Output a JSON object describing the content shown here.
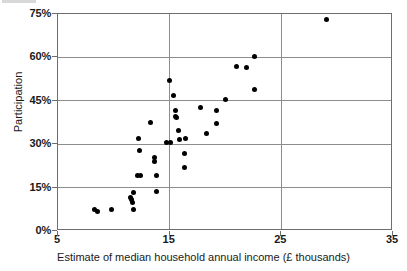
{
  "chart_data": {
    "type": "scatter",
    "title": "",
    "subtitle": "",
    "xlabel": "Estimate of median household annual income (£ thousands)",
    "ylabel": "Participation",
    "xlim": [
      5,
      35
    ],
    "ylim": [
      0,
      75
    ],
    "xticks": [
      5,
      15,
      25,
      35
    ],
    "xtick_labels": [
      "5",
      "15",
      "25",
      "35"
    ],
    "yticks": [
      0,
      15,
      30,
      45,
      60,
      75
    ],
    "ytick_labels": [
      "0%",
      "15%",
      "30%",
      "45%",
      "60%",
      "75%"
    ],
    "grid": "horizontal-and-vertical-at-major-ticks",
    "legend": null,
    "point_color": "#000000",
    "grid_color": "#8d8d8d",
    "frame_color": "#6e6e6e",
    "series": [
      {
        "name": "Local authorities",
        "points": [
          [
            8.3,
            7.3
          ],
          [
            8.5,
            6.6
          ],
          [
            9.8,
            7.3
          ],
          [
            11.5,
            11.6
          ],
          [
            11.6,
            10.9
          ],
          [
            11.7,
            10.0
          ],
          [
            11.8,
            13.4
          ],
          [
            11.8,
            7.6
          ],
          [
            12.1,
            19.2
          ],
          [
            12.4,
            19.2
          ],
          [
            12.2,
            32.0
          ],
          [
            12.3,
            27.9
          ],
          [
            13.3,
            37.4
          ],
          [
            13.6,
            25.4
          ],
          [
            13.6,
            24.0
          ],
          [
            13.8,
            19.2
          ],
          [
            13.8,
            13.5
          ],
          [
            15.0,
            52.0
          ],
          [
            15.3,
            46.8
          ],
          [
            15.5,
            41.5
          ],
          [
            15.5,
            39.6
          ],
          [
            15.6,
            39.3
          ],
          [
            15.8,
            34.6
          ],
          [
            15.9,
            31.7
          ],
          [
            16.4,
            31.8
          ],
          [
            16.3,
            26.7
          ],
          [
            16.3,
            21.9
          ],
          [
            14.7,
            30.6
          ],
          [
            15.1,
            30.5
          ],
          [
            17.8,
            42.6
          ],
          [
            18.3,
            33.6
          ],
          [
            19.2,
            41.8
          ],
          [
            19.2,
            37.1
          ],
          [
            20.0,
            45.6
          ],
          [
            21.0,
            56.9
          ],
          [
            21.9,
            56.6
          ],
          [
            22.6,
            60.4
          ],
          [
            22.6,
            48.8
          ],
          [
            29.0,
            73.2
          ]
        ]
      }
    ]
  },
  "axes": {
    "y_title": "Participation",
    "x_title": "Estimate of median household annual income (£ thousands)"
  }
}
